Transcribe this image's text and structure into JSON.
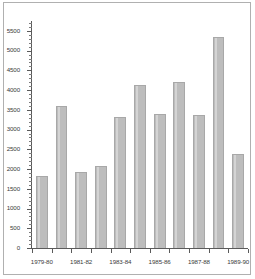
{
  "chart_data": {
    "type": "bar",
    "title": "",
    "subtitle": "",
    "xlabel": "",
    "ylabel": "",
    "ylim": [
      0,
      5750
    ],
    "grid": false,
    "legend": false,
    "categories": [
      "1979-80",
      "1980-81",
      "1981-82",
      "1982-83",
      "1983-84",
      "1984-85",
      "1985-86",
      "1986-87",
      "1987-88",
      "1988-89",
      "1989-90"
    ],
    "values": [
      1820,
      3600,
      1920,
      2070,
      3320,
      4130,
      3400,
      4210,
      3380,
      5350,
      2380
    ],
    "series": [
      {
        "name": "",
        "values": [
          1820,
          3600,
          1920,
          2070,
          3320,
          4130,
          3400,
          4210,
          3380,
          5350,
          2380
        ]
      }
    ],
    "y_ticks": [
      0,
      500,
      1000,
      1500,
      2000,
      2500,
      3000,
      3500,
      4000,
      4500,
      5000,
      5500
    ],
    "y_tick_labels": [
      "0",
      "500",
      "1000",
      "1500",
      "2000",
      "2500",
      "3000",
      "3500",
      "4000",
      "4500",
      "5000",
      "5500"
    ],
    "y_minor_tick_interval": 100,
    "x_tick_labels": [
      "1979-80",
      "",
      "1981-82",
      "",
      "1983-84",
      "",
      "1985-86",
      "",
      "1987-88",
      "",
      "1989-90"
    ],
    "bar_color": "#bdbdbd",
    "bar_edge_color": "#a8a8a8",
    "axis_color": "#5a5a5a",
    "frame_color": "#b0b0b0",
    "plot_background": "#ffffff"
  }
}
